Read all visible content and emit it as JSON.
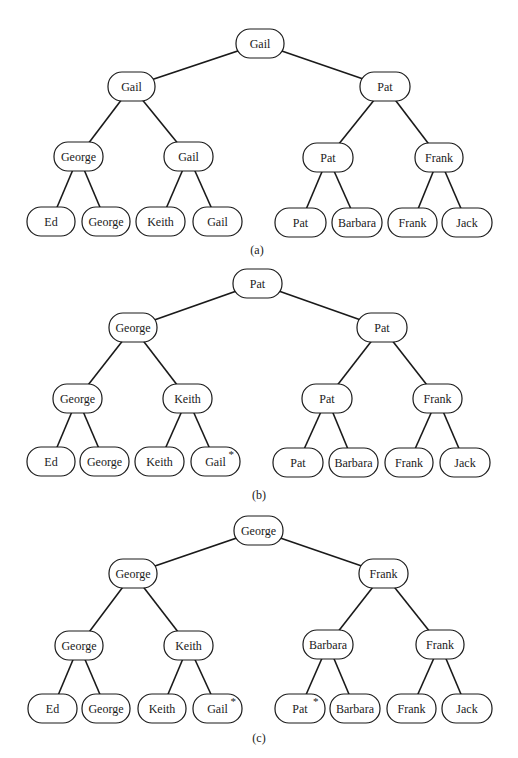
{
  "figure": {
    "width": 518,
    "height": 758,
    "node_height": 29,
    "node_radius": 14,
    "line_color": "#1a1a1a",
    "trees": [
      {
        "id": "a",
        "caption": "(a)",
        "caption_pos": [
          257,
          250
        ],
        "nodes": [
          {
            "id": "r",
            "label": "Gail",
            "x": 236,
            "y": 29,
            "w": 48
          },
          {
            "id": "l",
            "label": "Gail",
            "x": 108,
            "y": 72,
            "w": 47
          },
          {
            "id": "rr",
            "label": "Pat",
            "x": 360,
            "y": 72,
            "w": 50
          },
          {
            "id": "ll",
            "label": "George",
            "x": 54,
            "y": 142,
            "w": 49
          },
          {
            "id": "lr",
            "label": "Gail",
            "x": 164,
            "y": 142,
            "w": 49
          },
          {
            "id": "rl",
            "label": "Pat",
            "x": 303,
            "y": 143,
            "w": 50
          },
          {
            "id": "rrr",
            "label": "Frank",
            "x": 415,
            "y": 143,
            "w": 48
          },
          {
            "id": "f1",
            "label": "Ed",
            "x": 27,
            "y": 207,
            "w": 48
          },
          {
            "id": "f2",
            "label": "George",
            "x": 82,
            "y": 207,
            "w": 48
          },
          {
            "id": "f3",
            "label": "Keith",
            "x": 136,
            "y": 207,
            "w": 49
          },
          {
            "id": "f4",
            "label": "Gail",
            "x": 193,
            "y": 207,
            "w": 49
          },
          {
            "id": "f5",
            "label": "Pat",
            "x": 275,
            "y": 208,
            "w": 51
          },
          {
            "id": "f6",
            "label": "Barbara",
            "x": 332,
            "y": 208,
            "w": 50
          },
          {
            "id": "f7",
            "label": "Frank",
            "x": 388,
            "y": 208,
            "w": 49
          },
          {
            "id": "f8",
            "label": "Jack",
            "x": 442,
            "y": 208,
            "w": 50
          }
        ],
        "edges": [
          [
            "r",
            "l"
          ],
          [
            "r",
            "rr"
          ],
          [
            "l",
            "ll"
          ],
          [
            "l",
            "lr"
          ],
          [
            "rr",
            "rl"
          ],
          [
            "rr",
            "rrr"
          ],
          [
            "ll",
            "f1"
          ],
          [
            "ll",
            "f2"
          ],
          [
            "lr",
            "f3"
          ],
          [
            "lr",
            "f4"
          ],
          [
            "rl",
            "f5"
          ],
          [
            "rl",
            "f6"
          ],
          [
            "rrr",
            "f7"
          ],
          [
            "rrr",
            "f8"
          ]
        ]
      },
      {
        "id": "b",
        "caption": "(b)",
        "caption_pos": [
          259,
          495
        ],
        "nodes": [
          {
            "id": "r",
            "label": "Pat",
            "x": 233,
            "y": 269,
            "w": 49
          },
          {
            "id": "l",
            "label": "George",
            "x": 109,
            "y": 313,
            "w": 48
          },
          {
            "id": "rr",
            "label": "Pat",
            "x": 357,
            "y": 313,
            "w": 50
          },
          {
            "id": "ll",
            "label": "George",
            "x": 53,
            "y": 384,
            "w": 49
          },
          {
            "id": "lr",
            "label": "Keith",
            "x": 163,
            "y": 384,
            "w": 49
          },
          {
            "id": "rl",
            "label": "Pat",
            "x": 302,
            "y": 384,
            "w": 50
          },
          {
            "id": "rrr",
            "label": "Frank",
            "x": 413,
            "y": 384,
            "w": 49
          },
          {
            "id": "f1",
            "label": "Ed",
            "x": 27,
            "y": 447,
            "w": 48
          },
          {
            "id": "f2",
            "label": "George",
            "x": 80,
            "y": 447,
            "w": 49
          },
          {
            "id": "f3",
            "label": "Keith",
            "x": 135,
            "y": 447,
            "w": 49
          },
          {
            "id": "f4",
            "label": "Gail",
            "x": 191,
            "y": 447,
            "w": 49,
            "mark": "*"
          },
          {
            "id": "f5",
            "label": "Pat",
            "x": 273,
            "y": 448,
            "w": 50
          },
          {
            "id": "f6",
            "label": "Barbara",
            "x": 329,
            "y": 448,
            "w": 49
          },
          {
            "id": "f7",
            "label": "Frank",
            "x": 385,
            "y": 448,
            "w": 48
          },
          {
            "id": "f8",
            "label": "Jack",
            "x": 440,
            "y": 448,
            "w": 50
          }
        ],
        "edges": [
          [
            "r",
            "l"
          ],
          [
            "r",
            "rr"
          ],
          [
            "l",
            "ll"
          ],
          [
            "l",
            "lr"
          ],
          [
            "rr",
            "rl"
          ],
          [
            "rr",
            "rrr"
          ],
          [
            "ll",
            "f1"
          ],
          [
            "ll",
            "f2"
          ],
          [
            "lr",
            "f3"
          ],
          [
            "lr",
            "f4"
          ],
          [
            "rl",
            "f5"
          ],
          [
            "rl",
            "f6"
          ],
          [
            "rrr",
            "f7"
          ],
          [
            "rrr",
            "f8"
          ]
        ]
      },
      {
        "id": "c",
        "caption": "(c)",
        "caption_pos": [
          259,
          738
        ],
        "nodes": [
          {
            "id": "r",
            "label": "George",
            "x": 234,
            "y": 516,
            "w": 49
          },
          {
            "id": "l",
            "label": "George",
            "x": 109,
            "y": 559,
            "w": 48
          },
          {
            "id": "rr",
            "label": "Frank",
            "x": 359,
            "y": 559,
            "w": 49
          },
          {
            "id": "ll",
            "label": "George",
            "x": 55,
            "y": 631,
            "w": 48
          },
          {
            "id": "lr",
            "label": "Keith",
            "x": 164,
            "y": 631,
            "w": 49
          },
          {
            "id": "rl",
            "label": "Barbara",
            "x": 303,
            "y": 630,
            "w": 50
          },
          {
            "id": "rrr",
            "label": "Frank",
            "x": 416,
            "y": 630,
            "w": 48
          },
          {
            "id": "f1",
            "label": "Ed",
            "x": 28,
            "y": 694,
            "w": 49
          },
          {
            "id": "f2",
            "label": "George",
            "x": 82,
            "y": 694,
            "w": 48
          },
          {
            "id": "f3",
            "label": "Keith",
            "x": 138,
            "y": 694,
            "w": 48
          },
          {
            "id": "f4",
            "label": "Gail",
            "x": 193,
            "y": 694,
            "w": 49,
            "mark": "*"
          },
          {
            "id": "f5",
            "label": "Pat",
            "x": 275,
            "y": 694,
            "w": 50,
            "mark": "*"
          },
          {
            "id": "f6",
            "label": "Barbara",
            "x": 330,
            "y": 694,
            "w": 50
          },
          {
            "id": "f7",
            "label": "Frank",
            "x": 387,
            "y": 694,
            "w": 49
          },
          {
            "id": "f8",
            "label": "Jack",
            "x": 442,
            "y": 694,
            "w": 50
          }
        ],
        "edges": [
          [
            "r",
            "l"
          ],
          [
            "r",
            "rr"
          ],
          [
            "l",
            "ll"
          ],
          [
            "l",
            "lr"
          ],
          [
            "rr",
            "rl"
          ],
          [
            "rr",
            "rrr"
          ],
          [
            "ll",
            "f1"
          ],
          [
            "ll",
            "f2"
          ],
          [
            "lr",
            "f3"
          ],
          [
            "lr",
            "f4"
          ],
          [
            "rl",
            "f5"
          ],
          [
            "rl",
            "f6"
          ],
          [
            "rrr",
            "f7"
          ],
          [
            "rrr",
            "f8"
          ]
        ]
      }
    ]
  }
}
